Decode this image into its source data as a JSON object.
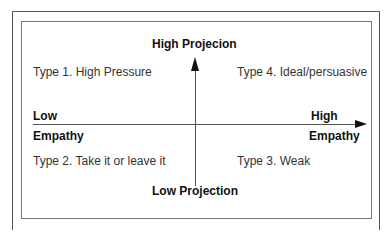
{
  "axes": {
    "vertical": {
      "top_label": "High Projecion",
      "bottom_label": "Low Projection"
    },
    "horizontal": {
      "left_label_line1": "Low",
      "left_label_line2": "Empathy",
      "right_label_line1": "High",
      "right_label_line2": "Empathy"
    }
  },
  "quadrants": {
    "top_left": "Type 1. High Pressure",
    "top_right": "Type 4. Ideal/persuasive",
    "bottom_left": "Type 2. Take it or leave it",
    "bottom_right": "Type 3. Weak"
  }
}
